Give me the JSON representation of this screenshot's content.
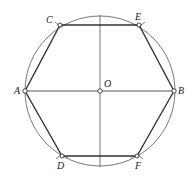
{
  "diagram": {
    "type": "geometry-construction",
    "colors": {
      "stroke": "#333333",
      "thin_stroke": "#555555",
      "background": "#ffffff"
    },
    "circle": {
      "cx": 100,
      "cy": 91,
      "r": 75
    },
    "points": {
      "O": {
        "label": "O",
        "x": 100,
        "y": 91
      },
      "A": {
        "label": "A",
        "x": 25,
        "y": 91
      },
      "B": {
        "label": "B",
        "x": 174,
        "y": 91
      },
      "C": {
        "label": "C",
        "x": 60,
        "y": 25
      },
      "E": {
        "label": "E",
        "x": 139,
        "y": 25
      },
      "D": {
        "label": "D",
        "x": 62,
        "y": 156
      },
      "F": {
        "label": "F",
        "x": 137,
        "y": 156
      }
    },
    "hexagon_order": [
      "A",
      "C",
      "E",
      "B",
      "F",
      "D"
    ],
    "diameters": [
      {
        "name": "horizontal",
        "from": "A",
        "to": "B"
      },
      {
        "name": "vertical",
        "x": 100,
        "y1": 15,
        "y2": 167
      }
    ]
  }
}
